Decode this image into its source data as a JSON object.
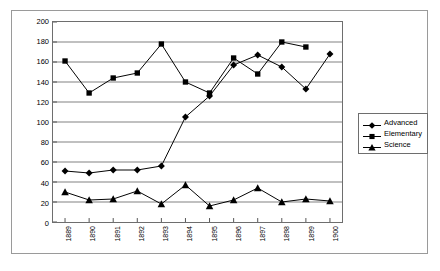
{
  "chart_data": {
    "type": "line",
    "title": "",
    "subtitle": "",
    "xlabel": "",
    "ylabel": "",
    "categories": [
      "1889",
      "1890",
      "1891",
      "1892",
      "1893",
      "1894",
      "1895",
      "1896",
      "1897",
      "1898",
      "1899",
      "1900"
    ],
    "ylim": [
      0,
      200
    ],
    "ytick_step": 20,
    "yticks": [
      "200",
      "180",
      "160",
      "140",
      "120",
      "100",
      "80",
      "60",
      "40",
      "20",
      "0"
    ],
    "grid": "horizontal",
    "legend_position": "right-outside",
    "series": [
      {
        "name": "Advanced",
        "marker": "diamond",
        "color": "#000000",
        "values": [
          51,
          49,
          52,
          52,
          56,
          105,
          126,
          157,
          167,
          155,
          133,
          168
        ]
      },
      {
        "name": "Elementary",
        "marker": "square",
        "color": "#000000",
        "values": [
          161,
          129,
          144,
          149,
          178,
          140,
          129,
          164,
          148,
          180,
          175,
          null
        ]
      },
      {
        "name": "Science",
        "marker": "triangle",
        "color": "#000000",
        "values": [
          30,
          22,
          23,
          31,
          18,
          37,
          16,
          22,
          34,
          20,
          23,
          21
        ]
      }
    ]
  }
}
